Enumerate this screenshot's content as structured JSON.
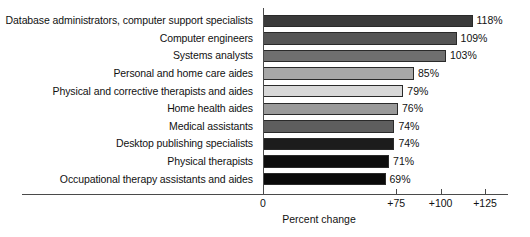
{
  "chart_data": {
    "type": "bar",
    "orientation": "horizontal",
    "title": "",
    "xlabel": "Percent change",
    "ylabel": "",
    "xlim": [
      0,
      125
    ],
    "grid": false,
    "legend": null,
    "xticks": [
      {
        "value": 0,
        "label": "0"
      },
      {
        "value": 75,
        "label": "+75"
      },
      {
        "value": 100,
        "label": "+100"
      },
      {
        "value": 125,
        "label": "+125"
      }
    ],
    "categories": [
      "Database administrators, computer support specialists",
      "Computer engineers",
      "Systems analysts",
      "Personal and home care aides",
      "Physical and corrective therapists and aides",
      "Home health aides",
      "Medical assistants",
      "Desktop publishing specialists",
      "Physical therapists",
      "Occupational therapy assistants and aides"
    ],
    "values": [
      118,
      109,
      103,
      85,
      79,
      76,
      74,
      74,
      71,
      69
    ],
    "value_labels": [
      "118%",
      "109%",
      "103%",
      "85%",
      "79%",
      "76%",
      "74%",
      "74%",
      "71%",
      "69%"
    ],
    "bar_colors": [
      "#3a3a3a",
      "#555555",
      "#6f6f6f",
      "#a8a8a8",
      "#d8d8d8",
      "#9a9a9a",
      "#5e5e5e",
      "#1c1c1c",
      "#0d0d0d",
      "#0a0a0a"
    ],
    "bar_border_color": "#2a2a2a",
    "axis_color": "#4a4a4a"
  }
}
